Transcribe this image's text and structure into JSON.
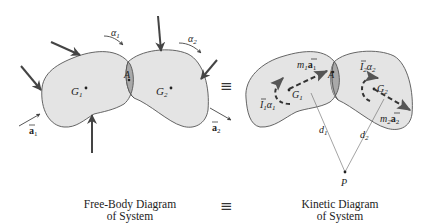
{
  "free_body": {
    "caption_line1": "Free-Body Diagram",
    "caption_line2": "of System",
    "labels": {
      "G1": "G",
      "G1_sub": "1",
      "G2": "G",
      "G2_sub": "2",
      "A": "A",
      "alpha1": "α",
      "alpha1_sub": "1",
      "alpha2": "α",
      "alpha2_sub": "2",
      "a1": "a",
      "a1_sub": "1",
      "a2": "a",
      "a2_sub": "2"
    }
  },
  "equivalence_symbol": "≡",
  "kinetic": {
    "caption_line1": "Kinetic Diagram",
    "caption_line2": "of System",
    "labels": {
      "G1": "G",
      "G1_sub": "1",
      "G2": "G",
      "G2_sub": "2",
      "A": "A",
      "m1a1_m": "m",
      "m1a1_msub": "1",
      "m1a1_a": "a",
      "m1a1_asub": "1",
      "m2a2_m": "m",
      "m2a2_msub": "2",
      "m2a2_a": "a",
      "m2a2_asub": "2",
      "I1alpha1_I": "I",
      "I1alpha1_Isub": "1",
      "I1alpha1_alpha": "α",
      "I1alpha1_asub": "1",
      "I2alpha2_I": "I",
      "I2alpha2_Isub": "2",
      "I2alpha2_alpha": "α",
      "I2alpha2_asub": "2",
      "d1": "d",
      "d1_sub": "1",
      "d2": "d",
      "d2_sub": "2",
      "P": "P"
    }
  },
  "colors": {
    "body_fill": "#e4e4e4",
    "overlap_fill": "#a9a9a9",
    "outline": "#555555",
    "arrow": "#444444"
  }
}
